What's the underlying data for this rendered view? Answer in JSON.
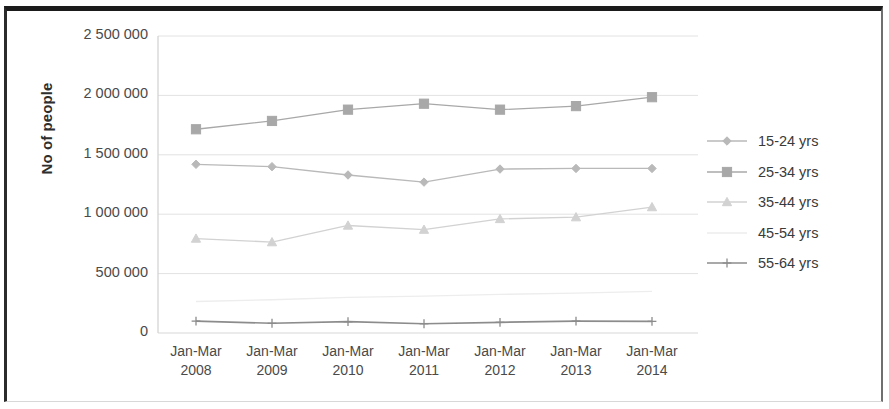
{
  "chart_data": {
    "type": "line",
    "title": "",
    "xlabel": "",
    "ylabel": "No of people",
    "categories": [
      "Jan-Mar 2008",
      "Jan-Mar 2009",
      "Jan-Mar 2010",
      "Jan-Mar 2011",
      "Jan-Mar 2012",
      "Jan-Mar 2013",
      "Jan-Mar 2014"
    ],
    "category_lines": [
      [
        "Jan-Mar",
        "2008"
      ],
      [
        "Jan-Mar",
        "2009"
      ],
      [
        "Jan-Mar",
        "2010"
      ],
      [
        "Jan-Mar",
        "2011"
      ],
      [
        "Jan-Mar",
        "2012"
      ],
      [
        "Jan-Mar",
        "2013"
      ],
      [
        "Jan-Mar",
        "2014"
      ]
    ],
    "ylim": [
      0,
      2500000
    ],
    "ytick_values": [
      2500000,
      2000000,
      1500000,
      1000000,
      500000,
      0
    ],
    "ytick_labels": [
      "2 500 000",
      "2 000 000",
      "1 500 000",
      "1 000 000",
      "500 000",
      "0"
    ],
    "grid": true,
    "legend_position": "right",
    "series": [
      {
        "name": "15-24 yrs",
        "marker": "diamond",
        "color": "#b9b9b9",
        "values": [
          1420000,
          1400000,
          1330000,
          1270000,
          1380000,
          1385000,
          1385000
        ]
      },
      {
        "name": "25-34 yrs",
        "marker": "square",
        "color": "#a8a8a8",
        "values": [
          1715000,
          1785000,
          1880000,
          1930000,
          1880000,
          1910000,
          1985000
        ]
      },
      {
        "name": "35-44 yrs",
        "marker": "triangle",
        "color": "#d2d2d2",
        "values": [
          795000,
          765000,
          905000,
          870000,
          960000,
          975000,
          1060000
        ]
      },
      {
        "name": "45-54 yrs",
        "marker": "none",
        "color": "#ededed",
        "values": [
          265000,
          280000,
          300000,
          310000,
          325000,
          335000,
          350000
        ]
      },
      {
        "name": "55-64 yrs",
        "marker": "cross",
        "color": "#8c8c8c",
        "values": [
          100000,
          82000,
          95000,
          78000,
          90000,
          100000,
          98000
        ]
      }
    ]
  },
  "legend": {
    "items": [
      {
        "label": "15-24 yrs"
      },
      {
        "label": "25-34 yrs"
      },
      {
        "label": "35-44 yrs"
      },
      {
        "label": "45-54 yrs"
      },
      {
        "label": "55-64 yrs"
      }
    ]
  },
  "colors": {
    "axis": "#c9c9c9",
    "grid": "#e2e2e2",
    "text": "#4a4a4a",
    "frame": "#1b1b1b"
  }
}
